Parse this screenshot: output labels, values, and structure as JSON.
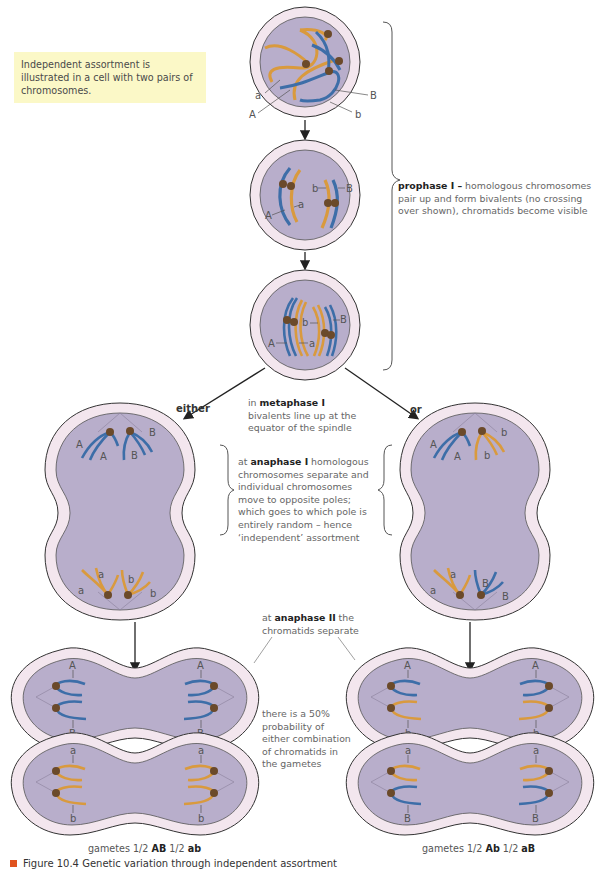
{
  "note": "Independent assortment is illustrated in a cell with two pairs of chromosomes.",
  "prophase": {
    "bold": "prophase I –",
    "text": " homologous chromosomes pair up and form bivalents (no crossing over shown), chromatids become visible"
  },
  "metaphase": {
    "pre": "in ",
    "bold": "metaphase I",
    "text": " bivalents line up at the equator of the spindle"
  },
  "anaphase1": {
    "pre": "at ",
    "bold": "anaphase I",
    "text": " homologous chromosomes separate and individual chromosomes move to opposite poles; which goes to which pole is entirely random – hence ‘independent’ assortment"
  },
  "anaphase2": {
    "pre": "at ",
    "bold": "anaphase II",
    "text": " the chromatids separate"
  },
  "probability": "there is a 50% probability of either combination of chromatids in the gametes",
  "branch_labels": {
    "either": "either",
    "or": "or"
  },
  "gametes_left": {
    "prefix": "gametes ",
    "half": "1/2",
    "g1": "AB",
    "g2": "ab"
  },
  "gametes_right": {
    "prefix": "gametes ",
    "half": "1/2",
    "g1": "Ab",
    "g2": "aB"
  },
  "caption": "Figure 10.4 Genetic variation through independent assortment",
  "allele_labels": {
    "A": "A",
    "a": "a",
    "B": "B",
    "b": "b"
  },
  "colors": {
    "blue_chromosome": "#3d6ea8",
    "orange_chromosome": "#d99a3e",
    "centromere": "#6b4a2a",
    "cytoplasm": "#b8aecb",
    "cell_membrane_ring": "#f3e6ee",
    "note_bg": "#fbf8c7",
    "caption_marker": "#e0531f"
  }
}
